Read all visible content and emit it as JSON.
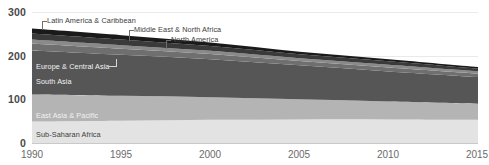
{
  "chart_data": {
    "type": "area",
    "title": "",
    "xlabel": "",
    "ylabel": "",
    "stacked": true,
    "grid": true,
    "legend_position": "inline-labels",
    "xlim": [
      1990,
      2015
    ],
    "ylim": [
      0,
      300
    ],
    "x": [
      1990,
      1995,
      2000,
      2005,
      2010,
      2015
    ],
    "yticks": [
      "0",
      "100",
      "200",
      "300"
    ],
    "xticks": [
      "1990",
      "1995",
      "2000",
      "2005",
      "2010",
      "2015"
    ],
    "series": [
      {
        "name": "Sub-Saharan Africa",
        "color": "#e3e3e3",
        "values": [
          49,
          51,
          53,
          54,
          54,
          53
        ]
      },
      {
        "name": "East Asia & Pacific",
        "color": "#b4b4b4",
        "values": [
          62,
          57,
          52,
          46,
          41,
          37
        ]
      },
      {
        "name": "South Asia",
        "color": "#565656",
        "values": [
          101,
          94,
          87,
          78,
          69,
          61
        ]
      },
      {
        "name": "Europe & Central Asia",
        "color": "#6f6f6f",
        "values": [
          16,
          14,
          12,
          10,
          9,
          8
        ]
      },
      {
        "name": "North America",
        "color": "#8a8a8a",
        "values": [
          9,
          8,
          7,
          6,
          6,
          5
        ]
      },
      {
        "name": "Middle East & North Africa",
        "color": "#3a3a3a",
        "values": [
          14,
          13,
          11,
          9,
          8,
          6
        ]
      },
      {
        "name": "Latin America & Caribbean",
        "color": "#1a1a1a",
        "values": [
          11,
          10,
          8,
          6,
          5,
          4
        ]
      }
    ],
    "totals": [
      262,
      247,
      230,
      209,
      192,
      174
    ]
  },
  "axis": {
    "y_labels": [
      {
        "text": "300",
        "value": 300
      },
      {
        "text": "200",
        "value": 200
      },
      {
        "text": "100",
        "value": 100
      },
      {
        "text": "0",
        "value": 0
      }
    ],
    "x_labels": [
      {
        "text": "1990",
        "value": 1990
      },
      {
        "text": "1995",
        "value": 1995
      },
      {
        "text": "2000",
        "value": 2000
      },
      {
        "text": "2005",
        "value": 2005
      },
      {
        "text": "2010",
        "value": 2010
      },
      {
        "text": "2015",
        "value": 2015
      }
    ]
  },
  "inline_labels": {
    "sub_saharan_africa": "Sub-Saharan Africa",
    "east_asia_pacific": "East Asia & Pacific",
    "south_asia": "South Asia",
    "europe_central_asia": "Europe & Central Asia"
  },
  "callouts": {
    "latin_america_caribbean": "Latin America & Caribbean",
    "middle_east_north_africa": "Middle East & North Africa",
    "north_america": "North America"
  }
}
